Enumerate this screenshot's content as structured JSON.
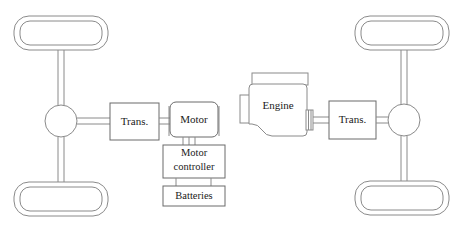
{
  "diagram": {
    "colors": {
      "line": "#8a8a8a",
      "line_dark": "#6a6a6a",
      "text": "#1a1a1a",
      "background": "#ffffff"
    },
    "left_powertrain": {
      "name": "electric-drive-axle",
      "components": {
        "transmission_label": "Trans.",
        "motor_label": "Motor",
        "motor_controller_label_line1": "Motor",
        "motor_controller_label_line2": "controller",
        "batteries_label": "Batteries"
      },
      "connections": {
        "motor_to_controller_phases": 3,
        "controller_to_batteries_leads": 2
      }
    },
    "right_powertrain": {
      "name": "engine-drive-axle",
      "components": {
        "engine_label": "Engine",
        "transmission_label": "Trans."
      }
    },
    "wheels": [
      {
        "name": "front-left-wheel",
        "position": "top-left"
      },
      {
        "name": "rear-left-wheel",
        "position": "bottom-left"
      },
      {
        "name": "front-right-wheel",
        "position": "top-right"
      },
      {
        "name": "rear-right-wheel",
        "position": "bottom-right"
      }
    ],
    "differentials": [
      {
        "name": "left-differential"
      },
      {
        "name": "right-differential"
      }
    ]
  }
}
